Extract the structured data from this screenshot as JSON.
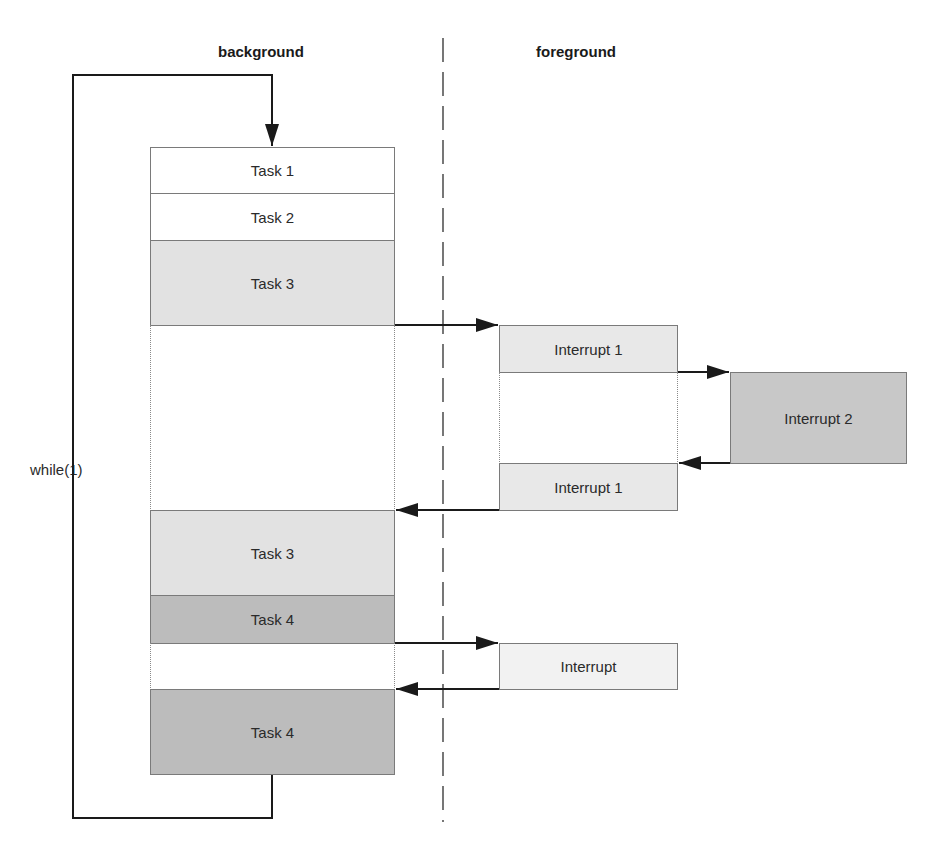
{
  "diagram": {
    "headings": {
      "background": "background",
      "foreground": "foreground"
    },
    "loop_label": "while(1)",
    "background_blocks": [
      {
        "label": "Task 1",
        "shade": "#ffffff"
      },
      {
        "label": "Task 2",
        "shade": "#ffffff"
      },
      {
        "label": "Task 3",
        "shade": "#e2e2e2"
      },
      {
        "label": "Task 3",
        "shade": "#e2e2e2"
      },
      {
        "label": "Task 4",
        "shade": "#bcbcbc"
      },
      {
        "label": "Task 4",
        "shade": "#bcbcbc"
      }
    ],
    "foreground_blocks": [
      {
        "label": "Interrupt 1",
        "shade": "#e8e8e8"
      },
      {
        "label": "Interrupt 2",
        "shade": "#c8c8c8"
      },
      {
        "label": "Interrupt 1",
        "shade": "#e8e8e8"
      },
      {
        "label": "Interrupt",
        "shade": "#f2f2f2"
      }
    ],
    "colors": {
      "line": "#1a1a1a",
      "border": "#7a7a7a",
      "divider": "#555555"
    }
  }
}
